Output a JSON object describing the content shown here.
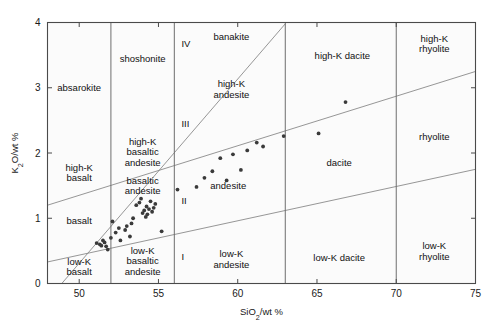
{
  "figure": {
    "background": "#ffffff",
    "plot_fill": "#fbfbfb",
    "axis_color": "#4a4a4a",
    "divider_color": "#6e6e6e",
    "point_color": "#3a3a3a"
  },
  "chart_data": {
    "type": "scatter",
    "title": "",
    "xlabel": "SiO2/wt %",
    "xlabel_parts": {
      "pre": "SiO",
      "sub": "2",
      "post": "/wt %"
    },
    "ylabel": "K2O/wt %",
    "ylabel_parts": {
      "pre": "K",
      "sub": "2",
      "post": "O/wt %"
    },
    "xlim": [
      48,
      75
    ],
    "ylim": [
      0,
      4
    ],
    "xticks": [
      50,
      55,
      60,
      65,
      70,
      75
    ],
    "xticklabels": [
      "50",
      "55",
      "60",
      "65",
      "70",
      "75"
    ],
    "yticks": [
      0,
      1,
      2,
      3,
      4
    ],
    "yticklabels": [
      "0",
      "1",
      "2",
      "3",
      "4"
    ],
    "grid": false,
    "legend": "none",
    "x": [
      51.1,
      51.3,
      51.4,
      51.5,
      51.6,
      51.7,
      51.8,
      52.0,
      52.1,
      52.3,
      52.5,
      52.6,
      52.9,
      53.0,
      53.2,
      53.3,
      53.4,
      53.6,
      53.8,
      53.9,
      54.0,
      54.1,
      54.2,
      54.25,
      54.3,
      54.4,
      54.5,
      54.6,
      54.7,
      54.8,
      55.2,
      56.2,
      57.4,
      57.9,
      58.4,
      58.9,
      59.3,
      59.7,
      60.2,
      60.6,
      61.2,
      61.6,
      62.9,
      65.1,
      66.8
    ],
    "y": [
      0.62,
      0.6,
      0.58,
      0.66,
      0.63,
      0.57,
      0.52,
      0.7,
      0.95,
      0.78,
      0.85,
      0.66,
      0.82,
      0.88,
      0.72,
      0.92,
      1.0,
      1.2,
      1.24,
      1.3,
      1.08,
      1.12,
      1.02,
      1.18,
      1.06,
      1.14,
      1.26,
      1.1,
      1.16,
      1.22,
      0.8,
      1.44,
      1.48,
      1.62,
      1.72,
      1.92,
      1.58,
      1.98,
      1.74,
      2.04,
      2.16,
      2.1,
      2.26,
      2.3,
      2.78
    ],
    "n_points": 45,
    "vertical_dividers": [
      52,
      56,
      63,
      70
    ],
    "sloped_boundaries": [
      {
        "name": "low-K upper bound",
        "from": [
          48,
          0.33
        ],
        "to": [
          75,
          1.75
        ]
      },
      {
        "name": "medium-K upper bound",
        "from": [
          48,
          1.2
        ],
        "to": [
          75,
          3.25
        ]
      },
      {
        "name": "high-K / shoshonite bound",
        "from": [
          48.9,
          0.0
        ],
        "to": [
          63,
          3.98
        ]
      }
    ]
  },
  "fields": [
    {
      "id": "absarokite",
      "label": "absarokite",
      "lines": [
        "absarokite"
      ],
      "x": 50.0,
      "y": 3.0
    },
    {
      "id": "shoshonite",
      "label": "shoshonite",
      "lines": [
        "shoshonite"
      ],
      "x": 54.0,
      "y": 3.45
    },
    {
      "id": "banakite",
      "label": "banakite",
      "lines": [
        "banakite"
      ],
      "x": 59.6,
      "y": 3.78
    },
    {
      "id": "high-k-dacite",
      "label": "high-K dacite",
      "lines": [
        "high-K dacite"
      ],
      "x": 66.6,
      "y": 3.5
    },
    {
      "id": "high-k-rhyolite",
      "label": "high-K rhyolite",
      "lines": [
        "high-K",
        "rhyolite"
      ],
      "x": 72.4,
      "y": 3.68
    },
    {
      "id": "high-k-andesite",
      "label": "high-K andesite",
      "lines": [
        "high-K",
        "andesite"
      ],
      "x": 59.6,
      "y": 2.98
    },
    {
      "id": "rhyolite",
      "label": "rhyolite",
      "lines": [
        "rhyolite"
      ],
      "x": 72.4,
      "y": 2.25
    },
    {
      "id": "dacite",
      "label": "dacite",
      "lines": [
        "dacite"
      ],
      "x": 66.4,
      "y": 1.85
    },
    {
      "id": "high-k-basaltic-andesite",
      "label": "high-K basaltic andesite",
      "lines": [
        "high-K",
        "basaltic",
        "andesite"
      ],
      "x": 54.0,
      "y": 2.02
    },
    {
      "id": "high-k-basalt",
      "label": "high-K basalt",
      "lines": [
        "high-K",
        "basalt"
      ],
      "x": 50.0,
      "y": 1.7
    },
    {
      "id": "basaltic-andesite",
      "label": "basaltic andesite",
      "lines": [
        "basaltic",
        "andesite"
      ],
      "x": 54.0,
      "y": 1.5
    },
    {
      "id": "andesite",
      "label": "andesite",
      "lines": [
        "andesite"
      ],
      "x": 59.4,
      "y": 1.5
    },
    {
      "id": "basalt",
      "label": "basalt",
      "lines": [
        "basalt"
      ],
      "x": 50.0,
      "y": 0.97
    },
    {
      "id": "low-k-basalt",
      "label": "low-K basalt",
      "lines": [
        "low-K",
        "basalt"
      ],
      "x": 50.0,
      "y": 0.26
    },
    {
      "id": "low-k-basaltic-andesite",
      "label": "low-K basaltic andesite",
      "lines": [
        "low-K",
        "basaltic",
        "andesite"
      ],
      "x": 54.0,
      "y": 0.35
    },
    {
      "id": "low-k-andesite",
      "label": "low-K andesite",
      "lines": [
        "low-K",
        "andesite"
      ],
      "x": 59.6,
      "y": 0.38
    },
    {
      "id": "low-k-dacite",
      "label": "low-K dacite",
      "lines": [
        "low-K dacite"
      ],
      "x": 66.4,
      "y": 0.4
    },
    {
      "id": "low-k-rhyolite",
      "label": "low-K rhyolite",
      "lines": [
        "low-K",
        "rhyolite"
      ],
      "x": 72.4,
      "y": 0.5
    }
  ],
  "roman_markers": [
    {
      "id": "roman-i",
      "label": "I",
      "x": 56.45,
      "y": 0.36
    },
    {
      "id": "roman-ii",
      "label": "II",
      "x": 56.45,
      "y": 1.22
    },
    {
      "id": "roman-iii",
      "label": "III",
      "x": 56.45,
      "y": 2.4
    },
    {
      "id": "roman-iv",
      "label": "IV",
      "x": 56.45,
      "y": 3.62
    }
  ]
}
